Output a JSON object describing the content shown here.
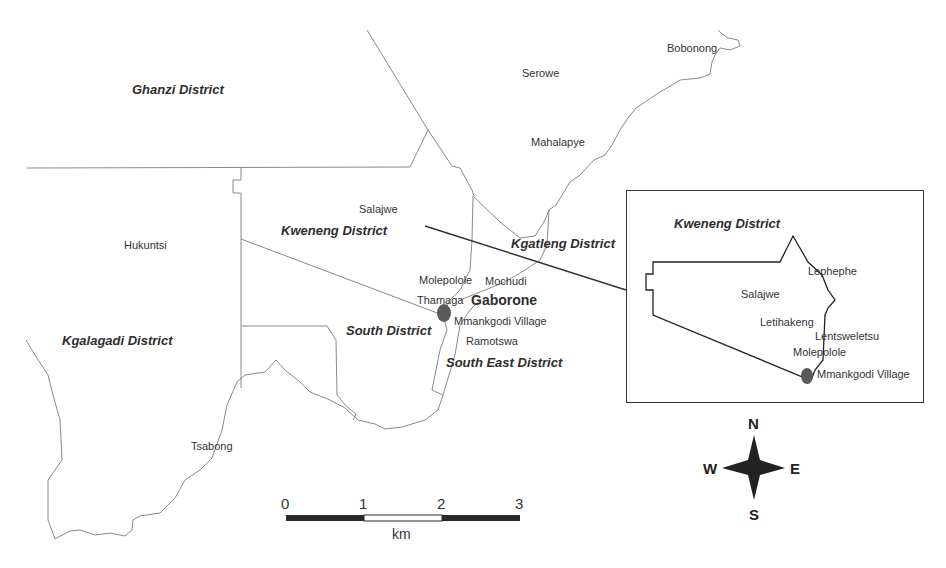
{
  "map": {
    "districts": [
      {
        "name": "Ghanzi District"
      },
      {
        "name": "Kweneng District"
      },
      {
        "name": "Kgatleng District"
      },
      {
        "name": "Kgalagadi District"
      },
      {
        "name": "South District"
      },
      {
        "name": "South East District"
      }
    ],
    "places": [
      {
        "name": "Bobonong"
      },
      {
        "name": "Serowe"
      },
      {
        "name": "Mahalapye"
      },
      {
        "name": "Salajwe"
      },
      {
        "name": "Hukuntsi"
      },
      {
        "name": "Molepolole"
      },
      {
        "name": "Mochudi"
      },
      {
        "name": "Thamaga"
      },
      {
        "name": "Mmankgodi Village"
      },
      {
        "name": "Ramotswa"
      },
      {
        "name": "Tsabong"
      }
    ],
    "capital": {
      "name": "Gaborone"
    },
    "marker_color": "#5a5a5a",
    "line_color": "#888888"
  },
  "inset": {
    "district": "Kweneng District",
    "places": [
      {
        "name": "Lephephe"
      },
      {
        "name": "Salajwe"
      },
      {
        "name": "Letihakeng"
      },
      {
        "name": "Lentsweletsu"
      },
      {
        "name": "Molepolole"
      },
      {
        "name": "Mmankgodi Village"
      }
    ]
  },
  "scale_bar": {
    "ticks": [
      "0",
      "1",
      "2",
      "3"
    ],
    "unit": "km"
  },
  "compass": {
    "north": "N",
    "south": "S",
    "east": "E",
    "west": "W"
  }
}
